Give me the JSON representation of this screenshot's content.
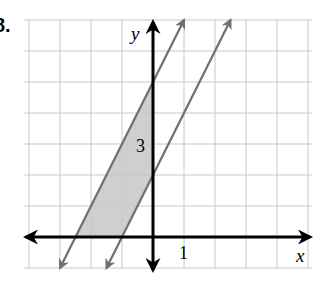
{
  "problem_number": "8.",
  "graph": {
    "x_axis_label": "x",
    "y_axis_label": "y",
    "x_tick_label": "1",
    "y_tick_label": "3",
    "x_range": [
      -4,
      5
    ],
    "y_range": [
      -1,
      7
    ],
    "grid_step": 1,
    "colors": {
      "grid": "#c8c8c8",
      "axes": "#000000",
      "lines": "#707070",
      "shading": "#cfcfcf"
    },
    "lines": [
      {
        "name": "upper-boundary",
        "equation": "y = 2x + 5",
        "slope": 2,
        "intercept": 5
      },
      {
        "name": "lower-boundary",
        "equation": "y = 2x + 2",
        "slope": 2,
        "intercept": 2
      }
    ],
    "shaded_region": "2x + 2 <= y <= 2x + 5, x <= 0, y >= 0"
  }
}
